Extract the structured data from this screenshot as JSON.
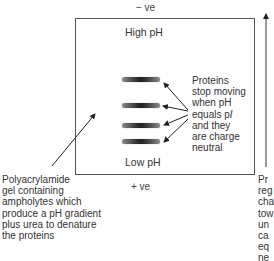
{
  "diagram": {
    "electrodes": {
      "top_label": "− ve",
      "bottom_label": "+ ve"
    },
    "gel": {
      "top_label": "High pH",
      "bottom_label": "Low pH"
    },
    "bands": [
      {
        "id": 1,
        "y": 80
      },
      {
        "id": 2,
        "y": 106
      },
      {
        "id": 3,
        "y": 126
      },
      {
        "id": 4,
        "y": 142
      }
    ],
    "annotations": {
      "proteins_note": {
        "lines": [
          "Proteins",
          "stop moving",
          "when pH",
          "equals pI",
          "and they",
          "are charge",
          "neutral"
        ]
      },
      "gel_note": {
        "lines": [
          "Polyacrylamide",
          "gel containing",
          "ampholytes which",
          "produce a pH gradient",
          "plus urea to denature",
          "the proteins"
        ]
      },
      "migration_note_clipped": {
        "lines": [
          "Pr",
          "reg",
          "cha",
          "tow",
          "un",
          "ca",
          "eq",
          "ne"
        ]
      }
    },
    "colors": {
      "line": "#555555",
      "text": "#333333",
      "band_dark": "#1f1f1f",
      "band_light": "#8a8a8a"
    }
  }
}
